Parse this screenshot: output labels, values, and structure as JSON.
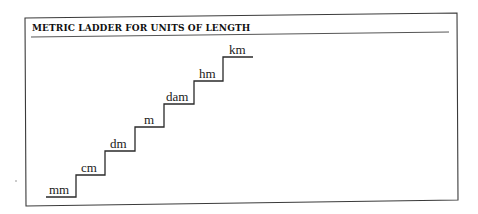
{
  "figure": {
    "title": "METRIC LADDER FOR UNITS OF LENGTH",
    "colors": {
      "line": "#2a2a2a",
      "frame": "#3a3a3a",
      "background": "#ffffff"
    }
  },
  "ladder": {
    "steps": [
      {
        "label": "mm"
      },
      {
        "label": "cm"
      },
      {
        "label": "dm"
      },
      {
        "label": "m"
      },
      {
        "label": "dam"
      },
      {
        "label": "hm"
      },
      {
        "label": "km"
      }
    ]
  }
}
